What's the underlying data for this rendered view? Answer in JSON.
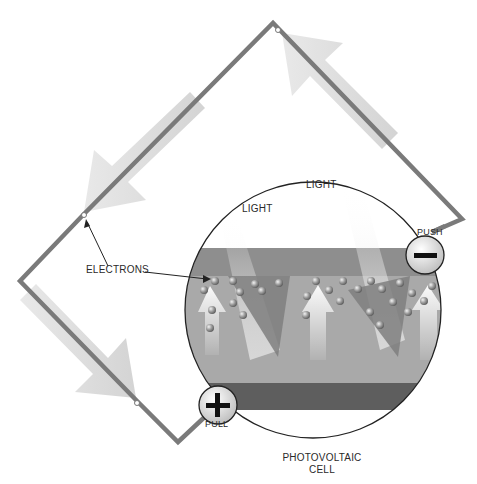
{
  "diagram": {
    "type": "photovoltaic-cell-circuit",
    "labels": {
      "light_top": "LIGHT",
      "light_left": "LIGHT",
      "electrons": "ELECTRONS",
      "push": "PUSH",
      "pull": "PULL",
      "cell_line1": "PHOTOVOLTAIC",
      "cell_line2": "CELL"
    },
    "terminals": {
      "negative": {
        "symbol": "minus",
        "label": "PUSH"
      },
      "positive": {
        "symbol": "plus",
        "label": "PULL"
      }
    },
    "colors": {
      "wire": "#7a7a7a",
      "arrow": "#d8d8d8",
      "layer_top": "#8e8e8e",
      "layer_middle": "#a9a9a9",
      "layer_bottom": "#5e5e5e",
      "electron": "#9a9a9a",
      "outline": "#222222"
    }
  }
}
